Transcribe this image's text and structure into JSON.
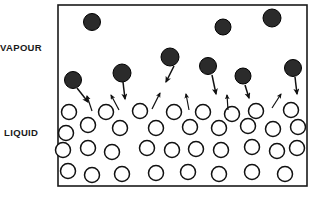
{
  "figure": {
    "width": 320,
    "height": 200,
    "background_color": "#ffffff"
  },
  "labels": {
    "vapour": "VAPOUR",
    "liquid": "LIQUID"
  },
  "colors": {
    "vapour_molecule_fill": "#2b2b2b",
    "vapour_molecule_stroke": "#000000",
    "liquid_molecule_fill": "#ffffff",
    "liquid_molecule_stroke": "#111111",
    "container_stroke": "#1a1a1a",
    "arrow_color": "#111111",
    "label_color": "#1a1a1a"
  },
  "container": {
    "x": 58,
    "y": 5,
    "width": 249,
    "height": 181,
    "stroke_width": 1.6
  },
  "vapour_molecules": [
    {
      "cx": 92,
      "cy": 22,
      "r": 8.5
    },
    {
      "cx": 223,
      "cy": 27,
      "r": 8.0
    },
    {
      "cx": 272,
      "cy": 18,
      "r": 9.0
    },
    {
      "cx": 170,
      "cy": 57,
      "r": 9.0
    },
    {
      "cx": 73,
      "cy": 80,
      "r": 8.5
    },
    {
      "cx": 122,
      "cy": 73,
      "r": 9.0
    },
    {
      "cx": 208,
      "cy": 66,
      "r": 8.5
    },
    {
      "cx": 243,
      "cy": 76,
      "r": 8.0
    },
    {
      "cx": 293,
      "cy": 68,
      "r": 8.5
    }
  ],
  "condensation_arrows": [
    {
      "x1": 77,
      "y1": 88,
      "x2": 88,
      "y2": 102
    },
    {
      "x1": 123,
      "y1": 82,
      "x2": 125,
      "y2": 99
    },
    {
      "x1": 174,
      "y1": 66,
      "x2": 166,
      "y2": 82
    },
    {
      "x1": 212,
      "y1": 75,
      "x2": 216,
      "y2": 94
    },
    {
      "x1": 245,
      "y1": 85,
      "x2": 249,
      "y2": 98
    },
    {
      "x1": 295,
      "y1": 77,
      "x2": 297,
      "y2": 94
    }
  ],
  "evaporation_arrows": [
    {
      "x1": 92,
      "y1": 111,
      "x2": 87,
      "y2": 96
    },
    {
      "x1": 119,
      "y1": 110,
      "x2": 111,
      "y2": 95
    },
    {
      "x1": 152,
      "y1": 109,
      "x2": 160,
      "y2": 93
    },
    {
      "x1": 189,
      "y1": 110,
      "x2": 186,
      "y2": 94
    },
    {
      "x1": 228,
      "y1": 110,
      "x2": 227,
      "y2": 95
    },
    {
      "x1": 272,
      "y1": 108,
      "x2": 281,
      "y2": 94
    }
  ],
  "liquid_molecules": [
    {
      "cx": 69,
      "cy": 112,
      "r": 7.5
    },
    {
      "cx": 106,
      "cy": 112,
      "r": 7.5
    },
    {
      "cx": 140,
      "cy": 111,
      "r": 7.5
    },
    {
      "cx": 174,
      "cy": 112,
      "r": 7.5
    },
    {
      "cx": 203,
      "cy": 112,
      "r": 7.5
    },
    {
      "cx": 232,
      "cy": 114,
      "r": 7.5
    },
    {
      "cx": 256,
      "cy": 111,
      "r": 7.5
    },
    {
      "cx": 291,
      "cy": 110,
      "r": 7.5
    },
    {
      "cx": 88,
      "cy": 125,
      "r": 7.5
    },
    {
      "cx": 120,
      "cy": 128,
      "r": 7.5
    },
    {
      "cx": 156,
      "cy": 128,
      "r": 7.5
    },
    {
      "cx": 190,
      "cy": 127,
      "r": 7.5
    },
    {
      "cx": 219,
      "cy": 128,
      "r": 7.5
    },
    {
      "cx": 248,
      "cy": 126,
      "r": 7.5
    },
    {
      "cx": 273,
      "cy": 129,
      "r": 7.5
    },
    {
      "cx": 298,
      "cy": 127,
      "r": 7.5
    },
    {
      "cx": 66,
      "cy": 133,
      "r": 7.5
    },
    {
      "cx": 63,
      "cy": 150,
      "r": 7.5
    },
    {
      "cx": 88,
      "cy": 148,
      "r": 7.5
    },
    {
      "cx": 112,
      "cy": 152,
      "r": 7.5
    },
    {
      "cx": 147,
      "cy": 148,
      "r": 7.5
    },
    {
      "cx": 172,
      "cy": 150,
      "r": 7.5
    },
    {
      "cx": 196,
      "cy": 149,
      "r": 7.5
    },
    {
      "cx": 221,
      "cy": 150,
      "r": 7.5
    },
    {
      "cx": 252,
      "cy": 147,
      "r": 7.5
    },
    {
      "cx": 277,
      "cy": 151,
      "r": 7.5
    },
    {
      "cx": 297,
      "cy": 148,
      "r": 7.5
    },
    {
      "cx": 68,
      "cy": 171,
      "r": 7.5
    },
    {
      "cx": 92,
      "cy": 175,
      "r": 7.5
    },
    {
      "cx": 122,
      "cy": 174,
      "r": 7.5
    },
    {
      "cx": 156,
      "cy": 173,
      "r": 7.5
    },
    {
      "cx": 188,
      "cy": 172,
      "r": 7.5
    },
    {
      "cx": 219,
      "cy": 174,
      "r": 7.5
    },
    {
      "cx": 252,
      "cy": 172,
      "r": 7.5
    },
    {
      "cx": 285,
      "cy": 174,
      "r": 7.5
    }
  ],
  "label_positions": {
    "vapour": {
      "x": 0,
      "y": 51
    },
    "liquid": {
      "x": 4,
      "y": 136
    }
  }
}
